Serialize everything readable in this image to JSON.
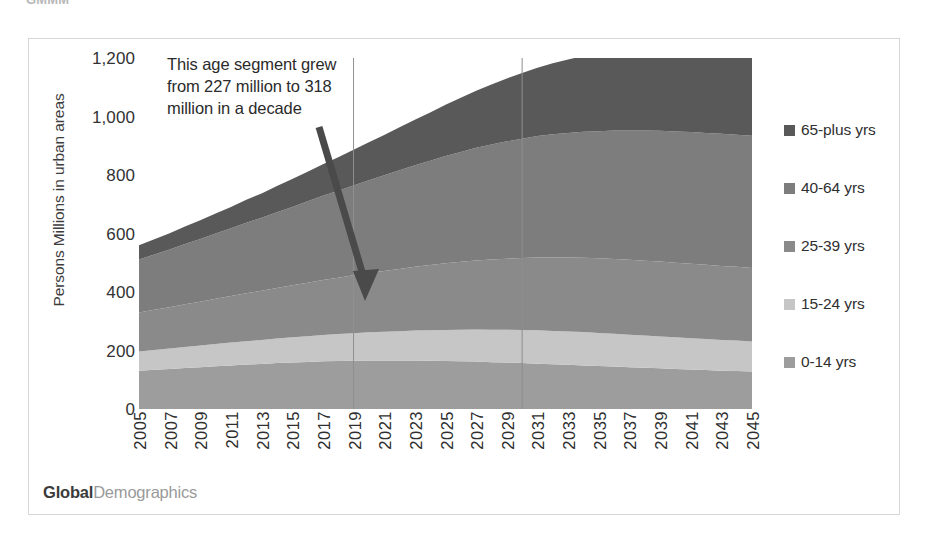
{
  "scan_artifact_text": "GMMM",
  "brand": {
    "primary": "Global",
    "secondary": "Demographics"
  },
  "legend": {
    "items": [
      {
        "label": "65-plus yrs",
        "color": "#595959"
      },
      {
        "label": "40-64 yrs",
        "color": "#7d7d7d"
      },
      {
        "label": "25-39 yrs",
        "color": "#8a8a8a"
      },
      {
        "label": "15-24 yrs",
        "color": "#c6c6c6"
      },
      {
        "label": "0-14 yrs",
        "color": "#9d9d9d"
      }
    ]
  },
  "annotation": {
    "text": "This age segment grew from 227 million to 318 million in a decade",
    "icon": "arrow-down-right-icon"
  },
  "chart_data": {
    "type": "area",
    "stacked": true,
    "title": "",
    "xlabel": "",
    "ylabel": "Persons Millions in urban areas",
    "ylim": [
      0,
      1200
    ],
    "yticks": [
      0,
      200,
      400,
      600,
      800,
      1000,
      1200
    ],
    "ytick_labels": [
      "0",
      "200",
      "400",
      "600",
      "800",
      "1,000",
      "1,200"
    ],
    "grid": "vertical-only",
    "gridline_years": [
      2019,
      2030
    ],
    "legend_position": "right",
    "x": [
      2005,
      2006,
      2007,
      2008,
      2009,
      2010,
      2011,
      2012,
      2013,
      2014,
      2015,
      2016,
      2017,
      2018,
      2019,
      2020,
      2021,
      2022,
      2023,
      2024,
      2025,
      2026,
      2027,
      2028,
      2029,
      2030,
      2031,
      2032,
      2033,
      2034,
      2035,
      2036,
      2037,
      2038,
      2039,
      2040,
      2041,
      2042,
      2043,
      2044,
      2045
    ],
    "xtick_labels": [
      "2005",
      "2007",
      "2009",
      "2011",
      "2013",
      "2015",
      "2017",
      "2019",
      "2021",
      "2023",
      "2025",
      "2027",
      "2029",
      "2031",
      "2033",
      "2035",
      "2037",
      "2039",
      "2041",
      "2043",
      "2045"
    ],
    "series": [
      {
        "name": "0-14 yrs",
        "color": "#9d9d9d",
        "values": [
          131,
          134,
          137,
          140,
          143,
          146,
          149,
          152,
          154,
          157,
          159,
          161,
          163,
          164,
          165,
          166,
          166,
          166,
          166,
          165,
          164,
          163,
          162,
          160,
          159,
          157,
          155,
          153,
          151,
          149,
          147,
          145,
          143,
          141,
          139,
          137,
          135,
          133,
          131,
          130,
          128
        ]
      },
      {
        "name": "15-24 yrs",
        "color": "#c6c6c6",
        "values": [
          66,
          68,
          70,
          72,
          74,
          76,
          78,
          80,
          82,
          84,
          86,
          88,
          90,
          92,
          94,
          96,
          98,
          100,
          102,
          104,
          106,
          108,
          110,
          111,
          112,
          113,
          114,
          114,
          114,
          114,
          113,
          112,
          111,
          110,
          109,
          108,
          107,
          106,
          105,
          104,
          103
        ]
      },
      {
        "name": "25-39 yrs",
        "color": "#8a8a8a",
        "values": [
          133,
          137,
          141,
          146,
          150,
          155,
          159,
          164,
          168,
          173,
          178,
          183,
          188,
          193,
          198,
          203,
          208,
          213,
          218,
          223,
          228,
          232,
          236,
          240,
          243,
          246,
          249,
          251,
          253,
          254,
          255,
          256,
          256,
          256,
          256,
          255,
          255,
          254,
          253,
          252,
          251
        ]
      },
      {
        "name": "40-64 yrs",
        "color": "#7d7d7d",
        "values": [
          181,
          189,
          197,
          206,
          214,
          223,
          232,
          241,
          250,
          259,
          268,
          278,
          288,
          297,
          307,
          317,
          327,
          337,
          347,
          357,
          367,
          376,
          385,
          393,
          401,
          408,
          415,
          421,
          426,
          431,
          435,
          439,
          442,
          445,
          447,
          449,
          450,
          451,
          452,
          452,
          452
        ]
      },
      {
        "name": "65-plus yrs",
        "color": "#595959",
        "values": [
          49,
          52,
          56,
          60,
          64,
          68,
          73,
          78,
          83,
          89,
          95,
          101,
          108,
          115,
          122,
          130,
          138,
          147,
          156,
          165,
          175,
          185,
          195,
          205,
          215,
          225,
          234,
          243,
          251,
          259,
          266,
          272,
          278,
          283,
          288,
          292,
          296,
          300,
          304,
          308,
          312
        ]
      }
    ],
    "annotations": [
      {
        "text": "This age segment grew from 227 million to 318 million in a decade",
        "points_to_series": "65-plus yrs"
      }
    ]
  }
}
